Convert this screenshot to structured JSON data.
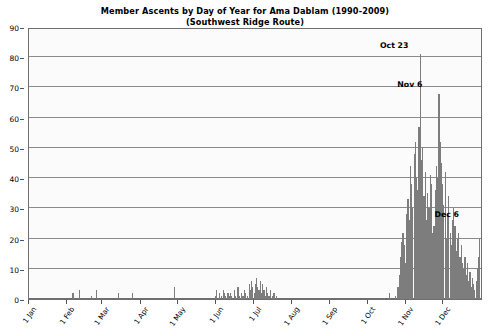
{
  "chart_data": {
    "type": "bar",
    "title": "Member Ascents by Day of Year for Ama Dablam (1990-2009)",
    "subtitle": "(Southwest Ridge Route)",
    "xlabel": "",
    "ylabel": "",
    "ylim": [
      0,
      90
    ],
    "ytick_step": 10,
    "grid": true,
    "legend": null,
    "bar_color": "#7d7d7d",
    "plot_background": "#fbfbfb",
    "frame_color": "#6f6f6f",
    "gridline_color": "#8a8a8a",
    "yticks": [
      0,
      10,
      20,
      30,
      40,
      50,
      60,
      70,
      80,
      90
    ],
    "xticks": [
      {
        "label": "1 Jan",
        "day": 1
      },
      {
        "label": "1 Feb",
        "day": 32
      },
      {
        "label": "1 Mar",
        "day": 60
      },
      {
        "label": "1 Apr",
        "day": 91
      },
      {
        "label": "1 May",
        "day": 121
      },
      {
        "label": "1 Jun",
        "day": 152
      },
      {
        "label": "1 Jul",
        "day": 182
      },
      {
        "label": "1 Aug",
        "day": 213
      },
      {
        "label": "1 Sep",
        "day": 244
      },
      {
        "label": "1 Oct",
        "day": 274
      },
      {
        "label": "1 Nov",
        "day": 305
      },
      {
        "label": "1 Dec",
        "day": 335
      }
    ],
    "annotations": [
      {
        "text": "Oct 23",
        "day": 296,
        "value": 81
      },
      {
        "text": "Nov 6",
        "day": 310,
        "value": 68
      },
      {
        "text": "Dec 6",
        "day": 340,
        "value": 25
      }
    ],
    "x_range": [
      1,
      366
    ],
    "x_unit": "day of year",
    "values_by_day": [
      0,
      0,
      0,
      0,
      0,
      0,
      0,
      0,
      0,
      0,
      0,
      0,
      0,
      0,
      0,
      0,
      0,
      0,
      0,
      0,
      0,
      0,
      0,
      0,
      0,
      0,
      0,
      0,
      0,
      0,
      0,
      0,
      0,
      0,
      0,
      2,
      0,
      0,
      0,
      0,
      3,
      0,
      0,
      0,
      0,
      0,
      0,
      0,
      0,
      0,
      1,
      0,
      0,
      0,
      3,
      0,
      0,
      0,
      0,
      0,
      0,
      0,
      0,
      0,
      0,
      0,
      0,
      0,
      0,
      0,
      0,
      0,
      2,
      0,
      0,
      0,
      0,
      0,
      0,
      0,
      0,
      0,
      0,
      2,
      0,
      0,
      0,
      0,
      0,
      0,
      0,
      0,
      0,
      0,
      0,
      0,
      0,
      0,
      0,
      0,
      0,
      0,
      0,
      0,
      0,
      0,
      0,
      0,
      0,
      0,
      0,
      0,
      0,
      0,
      0,
      0,
      0,
      4,
      0,
      0,
      0,
      0,
      0,
      0,
      0,
      0,
      0,
      0,
      0,
      0,
      0,
      0,
      0,
      0,
      0,
      0,
      0,
      0,
      0,
      0,
      0,
      0,
      0,
      0,
      0,
      0,
      0,
      0,
      0,
      0,
      1,
      3,
      0,
      2,
      0,
      1,
      3,
      2,
      1,
      0,
      2,
      1,
      2,
      1,
      0,
      3,
      1,
      0,
      4,
      1,
      0,
      2,
      1,
      3,
      2,
      0,
      1,
      5,
      3,
      6,
      4,
      2,
      5,
      7,
      4,
      3,
      6,
      2,
      5,
      3,
      1,
      4,
      2,
      1,
      3,
      0,
      1,
      2,
      0,
      1,
      0,
      0,
      0,
      0,
      0,
      0,
      0,
      0,
      0,
      0,
      0,
      0,
      0,
      0,
      0,
      0,
      0,
      0,
      0,
      0,
      0,
      0,
      0,
      0,
      0,
      0,
      0,
      0,
      0,
      0,
      0,
      0,
      0,
      0,
      0,
      0,
      0,
      0,
      0,
      0,
      0,
      0,
      0,
      0,
      0,
      0,
      0,
      0,
      0,
      0,
      0,
      0,
      0,
      0,
      0,
      0,
      0,
      0,
      0,
      0,
      0,
      0,
      0,
      0,
      0,
      0,
      0,
      0,
      0,
      0,
      0,
      0,
      0,
      0,
      0,
      0,
      0,
      0,
      0,
      0,
      0,
      0,
      0,
      0,
      0,
      0,
      0,
      0,
      0,
      0,
      2,
      0,
      0,
      0,
      0,
      1,
      0,
      4,
      8,
      14,
      19,
      22,
      18,
      12,
      28,
      33,
      26,
      44,
      38,
      30,
      48,
      52,
      40,
      36,
      57,
      81,
      46,
      50,
      34,
      42,
      26,
      35,
      30,
      41,
      38,
      22,
      24,
      36,
      44,
      40,
      68,
      52,
      45,
      38,
      31,
      42,
      20,
      28,
      34,
      22,
      18,
      26,
      30,
      24,
      16,
      20,
      22,
      14,
      18,
      12,
      10,
      14,
      8,
      12,
      6,
      9,
      4,
      7,
      5,
      3,
      6,
      10,
      14,
      20,
      25,
      18,
      12,
      8,
      14,
      6,
      4,
      9,
      3,
      7,
      2,
      5,
      3,
      4,
      1,
      2,
      1,
      3,
      0,
      1,
      0,
      0,
      0,
      0,
      0,
      0,
      0
    ]
  }
}
